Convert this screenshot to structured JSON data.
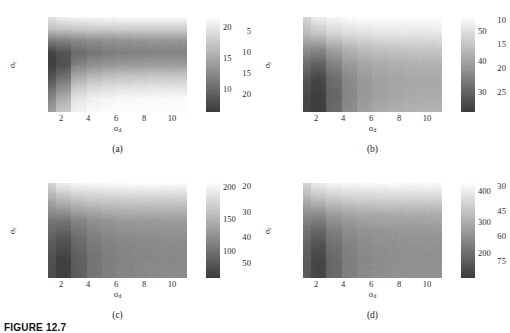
{
  "figure": {
    "caption": "FIGURE 12.7",
    "top_clipped_title": ""
  },
  "shared": {
    "xlabel_base": "σ",
    "xlabel_sub": "d",
    "ylabel_base": "σ",
    "ylabel_sub": "r",
    "xticks": [
      "2",
      "4",
      "6",
      "8",
      "10"
    ]
  },
  "panels": [
    {
      "tag": "(a)",
      "yticks": [
        "5",
        "10",
        "15",
        "20"
      ],
      "cbar_ticks": [
        "20",
        "15",
        "10"
      ]
    },
    {
      "tag": "(b)",
      "yticks": [
        "10",
        "15",
        "20",
        "25"
      ],
      "cbar_ticks": [
        "50",
        "40",
        "30"
      ]
    },
    {
      "tag": "(c)",
      "yticks": [
        "20",
        "30",
        "40",
        "50"
      ],
      "cbar_ticks": [
        "200",
        "150",
        "100"
      ]
    },
    {
      "tag": "(d)",
      "yticks": [
        "30",
        "45",
        "60",
        "75"
      ],
      "cbar_ticks": [
        "400",
        "300",
        "200"
      ]
    }
  ],
  "colors": {
    "background": "#ffffff",
    "text": "#2a2a2a",
    "colormap_low": "#4a4a4a",
    "colormap_high": "#ffffff"
  },
  "chart_data": [
    {
      "type": "heatmap",
      "title": "(a)",
      "xlabel": "sigma_d",
      "ylabel": "sigma_r",
      "x": [
        1,
        2,
        3,
        4,
        5,
        6,
        7,
        8,
        9,
        10
      ],
      "y": [
        2.5,
        5,
        7.5,
        10,
        12.5,
        15,
        17.5,
        20,
        22.5
      ],
      "xlim": [
        0.5,
        10.5
      ],
      "ylim": [
        1.25,
        21.25
      ],
      "zlim": [
        7.5,
        21.5
      ],
      "cbar_ticks": [
        10,
        15,
        20
      ],
      "grid": false,
      "values": [
        [
          19.5,
          20.5,
          20.8,
          21.0,
          21.1,
          21.2,
          21.2,
          21.3,
          21.3,
          21.3
        ],
        [
          17.0,
          17.4,
          17.6,
          17.8,
          17.9,
          18.0,
          18.0,
          18.1,
          18.1,
          18.1
        ],
        [
          12.0,
          12.4,
          13.0,
          13.4,
          13.6,
          13.8,
          13.9,
          14.0,
          14.0,
          14.0
        ],
        [
          8.0,
          9.2,
          11.0,
          11.8,
          12.2,
          12.4,
          12.5,
          12.6,
          12.6,
          12.6
        ],
        [
          7.6,
          9.0,
          12.6,
          13.6,
          14.0,
          14.3,
          14.4,
          14.5,
          14.5,
          14.5
        ],
        [
          9.0,
          11.0,
          15.5,
          16.6,
          17.1,
          17.4,
          17.5,
          17.6,
          17.6,
          17.6
        ],
        [
          11.0,
          13.6,
          18.0,
          19.0,
          19.4,
          19.6,
          19.7,
          19.8,
          19.8,
          19.8
        ],
        [
          13.0,
          16.0,
          20.0,
          20.7,
          21.0,
          21.2,
          21.3,
          21.3,
          21.4,
          21.4
        ],
        [
          14.5,
          17.5,
          20.8,
          21.2,
          21.4,
          21.5,
          21.5,
          21.5,
          21.5,
          21.5
        ]
      ]
    },
    {
      "type": "heatmap",
      "title": "(b)",
      "xlabel": "sigma_d",
      "ylabel": "sigma_r",
      "x": [
        1,
        2,
        3,
        4,
        5,
        6,
        7,
        8,
        9,
        10
      ],
      "y": [
        10,
        13,
        16,
        19,
        22,
        25,
        28
      ],
      "xlim": [
        0.5,
        10.5
      ],
      "ylim": [
        8.5,
        29.5
      ],
      "zlim": [
        24,
        56
      ],
      "cbar_ticks": [
        30,
        40,
        50
      ],
      "grid": false,
      "values": [
        [
          49.0,
          53.5,
          55.0,
          55.6,
          55.9,
          56.0,
          56.1,
          56.1,
          56.2,
          56.2
        ],
        [
          45.0,
          47.0,
          49.5,
          51.0,
          51.6,
          52.0,
          52.2,
          52.3,
          52.3,
          52.4
        ],
        [
          38.0,
          37.0,
          41.0,
          44.0,
          45.5,
          46.3,
          46.7,
          47.0,
          47.1,
          47.2
        ],
        [
          32.0,
          30.0,
          35.5,
          39.5,
          41.5,
          42.5,
          43.0,
          43.3,
          43.5,
          43.6
        ],
        [
          28.0,
          25.5,
          32.0,
          37.0,
          39.5,
          40.8,
          41.5,
          41.9,
          42.1,
          42.2
        ],
        [
          26.0,
          24.2,
          31.0,
          36.5,
          39.5,
          41.0,
          41.8,
          42.2,
          42.5,
          42.6
        ],
        [
          25.5,
          24.0,
          31.5,
          37.5,
          40.5,
          42.2,
          43.0,
          43.5,
          43.7,
          43.8
        ]
      ]
    },
    {
      "type": "heatmap",
      "title": "(c)",
      "xlabel": "sigma_d",
      "ylabel": "sigma_r",
      "x": [
        1,
        2,
        3,
        4,
        5,
        6,
        7,
        8,
        9,
        10
      ],
      "y": [
        20,
        26,
        32,
        38,
        44,
        50
      ],
      "xlim": [
        0.5,
        10.5
      ],
      "ylim": [
        17,
        53
      ],
      "zlim": [
        75,
        215
      ],
      "cbar_ticks": [
        100,
        150,
        200
      ],
      "grid": false,
      "values": [
        [
          185.0,
          205.0,
          210.0,
          212.0,
          213.0,
          213.5,
          214.0,
          214.0,
          214.0,
          214.0
        ],
        [
          150.0,
          160.0,
          168.0,
          172.0,
          174.0,
          175.0,
          175.5,
          176.0,
          176.0,
          176.0
        ],
        [
          118.0,
          115.0,
          128.0,
          136.0,
          140.0,
          142.0,
          143.0,
          143.5,
          144.0,
          144.0
        ],
        [
          100.0,
          92.0,
          110.0,
          122.0,
          128.0,
          131.0,
          132.5,
          133.5,
          134.0,
          134.0
        ],
        [
          90.0,
          78.0,
          101.0,
          116.0,
          123.0,
          127.0,
          129.0,
          130.0,
          130.5,
          131.0
        ],
        [
          88.0,
          76.0,
          100.0,
          117.0,
          125.0,
          129.0,
          131.0,
          132.0,
          132.5,
          133.0
        ]
      ]
    },
    {
      "type": "heatmap",
      "title": "(d)",
      "xlabel": "sigma_d",
      "ylabel": "sigma_r",
      "x": [
        1,
        2,
        3,
        4,
        5,
        6,
        7,
        8,
        9,
        10
      ],
      "y": [
        30,
        39,
        48,
        57,
        66,
        75,
        84
      ],
      "xlim": [
        0.5,
        10.5
      ],
      "ylim": [
        26,
        88
      ],
      "zlim": [
        150,
        430
      ],
      "cbar_ticks": [
        200,
        300,
        400
      ],
      "grid": false,
      "values": [
        [
          370.0,
          405.0,
          418.0,
          422.0,
          424.0,
          425.0,
          426.0,
          426.0,
          426.0,
          426.0
        ],
        [
          320.0,
          340.0,
          355.0,
          362.0,
          365.0,
          367.0,
          368.0,
          368.0,
          369.0,
          369.0
        ],
        [
          265.0,
          262.0,
          288.0,
          300.0,
          306.0,
          309.0,
          310.0,
          311.0,
          311.0,
          312.0
        ],
        [
          228.0,
          212.0,
          248.0,
          268.0,
          277.0,
          281.0,
          283.0,
          284.0,
          285.0,
          285.0
        ],
        [
          205.0,
          180.0,
          226.0,
          252.0,
          264.0,
          270.0,
          272.0,
          273.0,
          274.0,
          274.0
        ],
        [
          196.0,
          162.0,
          216.0,
          247.0,
          261.0,
          267.0,
          270.0,
          272.0,
          272.0,
          273.0
        ],
        [
          194.0,
          160.0,
          216.0,
          249.0,
          264.0,
          271.0,
          274.0,
          275.0,
          276.0,
          276.0
        ]
      ]
    }
  ]
}
